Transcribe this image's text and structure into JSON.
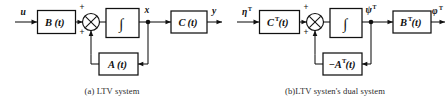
{
  "figure": {
    "name": "ltv-system-and-dual-system-block-diagrams",
    "background_color": "#ffffff",
    "line_color": "#111111"
  },
  "panels": [
    {
      "id": "a",
      "caption": "(a) LTV system",
      "input_signal": "u",
      "state_signal": "x",
      "output_signal": "y",
      "blocks": [
        {
          "name": "input-gain-block",
          "label_main": "B",
          "label_sup": "",
          "label_arg": "(t)"
        },
        {
          "name": "integrator-block",
          "label_main": "∫",
          "label_sup": "",
          "label_arg": ""
        },
        {
          "name": "output-gain-block",
          "label_main": "C",
          "label_sup": "",
          "label_arg": "(t)"
        },
        {
          "name": "feedback-block",
          "label_main": "A",
          "label_sup": "",
          "label_arg": "(t)"
        }
      ],
      "summing_junction": {
        "name": "summing-junction",
        "sign_top": "+",
        "sign_bottom": "+"
      }
    },
    {
      "id": "b",
      "caption": "(b)LTV systen's dual system",
      "input_signal": "η",
      "input_signal_sup": "T",
      "state_signal": "ψ",
      "state_signal_sup": "T",
      "output_signal": "φ",
      "output_signal_sup": "T",
      "blocks": [
        {
          "name": "input-gain-block",
          "label_main": "C",
          "label_sup": "T",
          "label_arg": "(t)"
        },
        {
          "name": "integrator-block",
          "label_main": "∫",
          "label_sup": "",
          "label_arg": ""
        },
        {
          "name": "output-gain-block",
          "label_main": "B",
          "label_sup": "T",
          "label_arg": "(t)"
        },
        {
          "name": "feedback-block",
          "label_main": "−A",
          "label_sup": "T",
          "label_arg": "(t)"
        }
      ],
      "summing_junction": {
        "name": "summing-junction",
        "sign_top": "+",
        "sign_bottom": "+"
      }
    }
  ]
}
